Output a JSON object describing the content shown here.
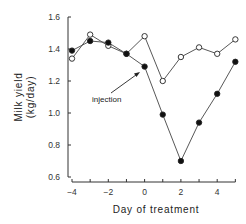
{
  "chart_data": {
    "type": "line",
    "title": "",
    "xlabel": "Day of treatment",
    "ylabel_line1": "Milk yield",
    "ylabel_line2": "(kg/day)",
    "xlim": [
      -4,
      5
    ],
    "ylim": [
      0.6,
      1.6
    ],
    "x_ticks": [
      -4,
      -2,
      0,
      2,
      4
    ],
    "x_tick_labels": [
      "−4",
      "−2",
      "0",
      "2",
      "4"
    ],
    "y_ticks": [
      0.6,
      0.8,
      1.0,
      1.2,
      1.4,
      1.6
    ],
    "y_tick_labels": [
      "0.6",
      "0.8",
      "1.0",
      "1.2",
      "1.4",
      "1.6"
    ],
    "grid": false,
    "legend": null,
    "x": [
      -4,
      -3,
      -2,
      -1,
      0,
      1,
      2,
      3,
      4,
      5
    ],
    "series": [
      {
        "name": "open-circles",
        "marker": "open-circle",
        "values": [
          1.34,
          1.49,
          1.42,
          1.37,
          1.48,
          1.2,
          1.35,
          1.41,
          1.37,
          1.46
        ]
      },
      {
        "name": "filled-circles",
        "marker": "filled-circle",
        "values": [
          1.39,
          1.45,
          1.44,
          1.37,
          1.29,
          0.99,
          0.7,
          0.94,
          1.12,
          1.32
        ]
      }
    ],
    "annotations": [
      {
        "text": "injection",
        "arrow_to": {
          "x": -0.2,
          "y": 1.27
        }
      }
    ]
  }
}
